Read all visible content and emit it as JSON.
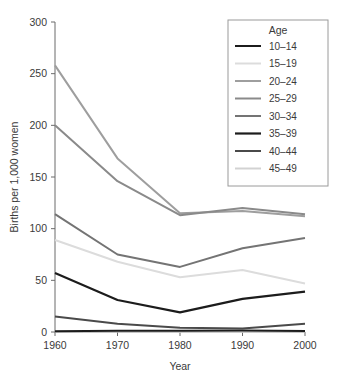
{
  "chart_data": {
    "type": "line",
    "title": "",
    "xlabel": "Year",
    "ylabel": "Births per 1,000 women",
    "x": [
      1960,
      1970,
      1980,
      1990,
      2000
    ],
    "xtick_labels": [
      "1960",
      "1970",
      "1980",
      "1990",
      "2000"
    ],
    "ytick_labels": [
      "0",
      "50",
      "100",
      "150",
      "200",
      "250",
      "300"
    ],
    "ytick_values": [
      0,
      50,
      100,
      150,
      200,
      250,
      300
    ],
    "xlim": [
      1960,
      2000
    ],
    "ylim": [
      0,
      300
    ],
    "grid": false,
    "legend_position": "top-right",
    "legend_title": "Age",
    "series": [
      {
        "name": "10–14",
        "color": "#1c1c1c",
        "width": 2.0,
        "values": [
          0.8,
          1.2,
          1.1,
          1.4,
          0.9
        ]
      },
      {
        "name": "15–19",
        "color": "#dcdcdc",
        "width": 2.0,
        "values": [
          89,
          68,
          53,
          60,
          47
        ]
      },
      {
        "name": "20–24",
        "color": "#9e9e9e",
        "width": 2.0,
        "values": [
          258,
          168,
          115,
          117,
          112
        ]
      },
      {
        "name": "25–29",
        "color": "#8a8a8a",
        "width": 2.0,
        "values": [
          200,
          146,
          113,
          120,
          114
        ]
      },
      {
        "name": "30–34",
        "color": "#747474",
        "width": 2.0,
        "values": [
          114,
          75,
          63,
          81,
          91
        ]
      },
      {
        "name": "35–39",
        "color": "#1c1c1c",
        "width": 2.2,
        "values": [
          57,
          31,
          19,
          32,
          39
        ]
      },
      {
        "name": "40–44",
        "color": "#4a4a4a",
        "width": 2.0,
        "values": [
          15,
          8,
          4,
          3.5,
          8
        ]
      },
      {
        "name": "45–49",
        "color": "#d2d2d2",
        "width": 2.0,
        "values": [
          0.6,
          0.4,
          0.2,
          0.2,
          0.5
        ]
      }
    ]
  },
  "colors": {
    "axis": "#6b6b6b",
    "text": "#3a3a3a",
    "legend_border": "#9a9a9a",
    "background": "#ffffff"
  }
}
